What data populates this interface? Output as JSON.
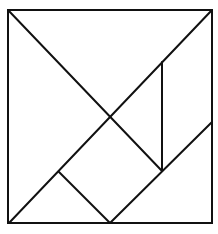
{
  "diagram": {
    "type": "tangram",
    "stroke_color": "#111111",
    "background_color": "#ffffff",
    "frame": {
      "x1": 8,
      "y1": 10,
      "x2": 212,
      "y2": 223
    },
    "lines": [
      {
        "id": "diag-tl-br-upper",
        "x1": 8,
        "y1": 10,
        "x2": 162,
        "y2": 171
      },
      {
        "id": "diag-bl-tr",
        "x1": 9,
        "y1": 223,
        "x2": 212,
        "y2": 10
      },
      {
        "id": "vertical-right-inner",
        "x1": 162,
        "y1": 62,
        "x2": 162,
        "y2": 171
      },
      {
        "id": "lower-right-diagonal",
        "x1": 110,
        "y1": 223,
        "x2": 212,
        "y2": 122
      },
      {
        "id": "small-square-left-edge",
        "x1": 59,
        "y1": 172,
        "x2": 110,
        "y2": 223
      }
    ],
    "pieces": [
      "large-triangle-left",
      "large-triangle-top",
      "medium-triangle-bottom-right",
      "small-triangle-bottom-left",
      "small-triangle-center-right",
      "square",
      "parallelogram-right"
    ]
  }
}
